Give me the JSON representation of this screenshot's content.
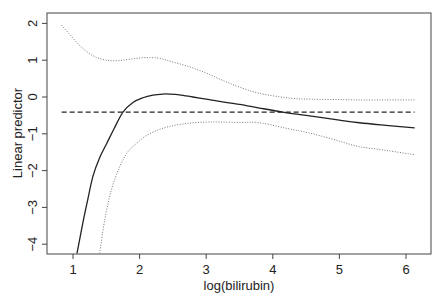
{
  "chart_data": {
    "type": "line",
    "title": "",
    "xlabel": "log(bilirubin)",
    "ylabel": "Linear predictor",
    "xlim": [
      0.6,
      6.35
    ],
    "ylim": [
      -4.25,
      2.3
    ],
    "xticks": [
      1,
      2,
      3,
      4,
      5,
      6
    ],
    "yticks": [
      -4,
      -3,
      -2,
      -1,
      0,
      1,
      2
    ],
    "xtick_labels": [
      "1",
      "2",
      "3",
      "4",
      "5",
      "6"
    ],
    "ytick_labels": [
      "−4",
      "−3",
      "−2",
      "−1",
      "0",
      "1",
      "2"
    ],
    "grid": false,
    "legend": null,
    "series": [
      {
        "name": "fit",
        "style": "solid",
        "color": "#222222",
        "x": [
          1.06,
          1.15,
          1.22,
          1.3,
          1.4,
          1.51,
          1.62,
          1.75,
          1.9,
          2.05,
          2.2,
          2.35,
          2.45,
          2.6,
          2.8,
          3.0,
          3.2,
          3.5,
          3.8,
          4.15,
          4.5,
          5.0,
          5.3,
          5.7,
          6.13
        ],
        "y": [
          -4.25,
          -3.4,
          -2.8,
          -2.15,
          -1.65,
          -1.25,
          -0.85,
          -0.41,
          -0.15,
          -0.02,
          0.05,
          0.08,
          0.08,
          0.06,
          0.0,
          -0.06,
          -0.12,
          -0.2,
          -0.3,
          -0.41,
          -0.5,
          -0.63,
          -0.7,
          -0.77,
          -0.84
        ]
      },
      {
        "name": "upper band",
        "style": "dotted",
        "color": "#777777",
        "x": [
          0.83,
          0.95,
          1.1,
          1.3,
          1.5,
          1.7,
          1.9,
          2.1,
          2.3,
          2.5,
          2.75,
          3.0,
          3.25,
          3.5,
          3.8,
          4.25,
          4.6,
          5.0,
          5.3,
          5.7,
          6.13
        ],
        "y": [
          1.95,
          1.7,
          1.4,
          1.12,
          1.0,
          0.99,
          1.04,
          1.07,
          1.05,
          0.95,
          0.82,
          0.65,
          0.45,
          0.27,
          0.1,
          -0.03,
          -0.06,
          -0.07,
          -0.08,
          -0.08,
          -0.08
        ]
      },
      {
        "name": "lower band",
        "style": "dotted",
        "color": "#777777",
        "x": [
          1.4,
          1.48,
          1.58,
          1.7,
          1.82,
          1.96,
          2.1,
          2.3,
          2.5,
          2.75,
          3.0,
          3.2,
          3.5,
          3.8,
          4.2,
          4.6,
          5.0,
          5.3,
          5.7,
          6.13
        ],
        "y": [
          -4.25,
          -3.3,
          -2.5,
          -1.9,
          -1.5,
          -1.25,
          -1.05,
          -0.88,
          -0.78,
          -0.71,
          -0.68,
          -0.68,
          -0.69,
          -0.7,
          -0.85,
          -1.0,
          -1.2,
          -1.35,
          -1.45,
          -1.57
        ]
      },
      {
        "name": "reference",
        "style": "dashed",
        "color": "#222222",
        "x": [
          0.83,
          6.13
        ],
        "y": [
          -0.41,
          -0.41
        ]
      }
    ]
  }
}
